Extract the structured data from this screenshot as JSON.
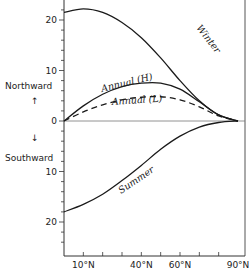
{
  "chart_data": {
    "type": "line",
    "title": "",
    "xlabel": "",
    "ylabel": "",
    "y_direction_labels": {
      "positive": "Northward",
      "negative": "Southward"
    },
    "x_ticks": [
      "10°N",
      "40°N",
      "60°N",
      "90°N"
    ],
    "x_range": [
      0,
      90
    ],
    "y_tick_labels": [
      "20",
      "10",
      "0",
      "10",
      "20"
    ],
    "y_tick_values": [
      20,
      10,
      0,
      -10,
      -20
    ],
    "ylim": [
      -25,
      23.5
    ],
    "grid": false,
    "x": [
      0,
      10,
      20,
      30,
      40,
      50,
      60,
      70,
      80,
      90
    ],
    "series": [
      {
        "name": "Winter",
        "style": "solid",
        "values": [
          21.5,
          22.2,
          21.5,
          19.5,
          16.5,
          12.5,
          8.0,
          4.0,
          1.2,
          0.0
        ]
      },
      {
        "name": "Annual (H)",
        "style": "solid",
        "values": [
          0.0,
          3.0,
          5.3,
          6.8,
          7.5,
          7.5,
          6.3,
          3.8,
          1.2,
          0.0
        ]
      },
      {
        "name": "Annual (L)",
        "style": "dashed",
        "values": [
          0.0,
          1.8,
          3.2,
          4.2,
          4.7,
          4.8,
          4.2,
          2.8,
          1.0,
          0.0
        ]
      },
      {
        "name": "Summer",
        "style": "solid",
        "values": [
          -18.0,
          -16.5,
          -14.5,
          -11.8,
          -8.8,
          -5.6,
          -3.0,
          -1.2,
          -0.3,
          0.0
        ]
      }
    ],
    "annotations": [
      "Winter",
      "Annual (H)",
      "Annual (L)",
      "Summer"
    ]
  },
  "labels": {
    "northward": "Northward",
    "southward": "Southward",
    "north_arrow": "↑",
    "south_arrow": "↓"
  }
}
